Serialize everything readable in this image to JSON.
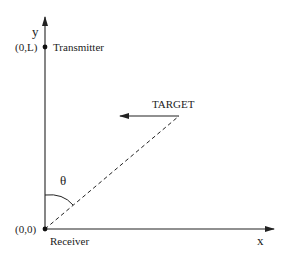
{
  "diagram": {
    "axes": {
      "x_label": "x",
      "y_label": "y"
    },
    "points": {
      "origin": {
        "coord_label": "(0,0)",
        "name": "Receiver"
      },
      "transmitter": {
        "coord_label": "(0,L)",
        "name": "Transmitter"
      }
    },
    "target": {
      "label": "TARGET",
      "direction": "left"
    },
    "angle": {
      "label": "θ"
    },
    "colors": {
      "stroke": "#222222",
      "background": "#ffffff"
    }
  }
}
